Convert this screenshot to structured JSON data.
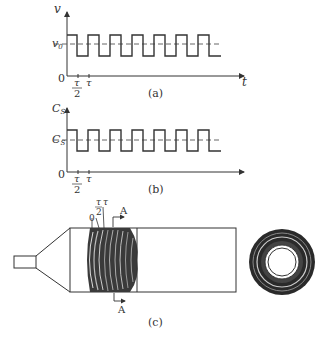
{
  "panel_a": {
    "y_label": "v",
    "x_label": "t",
    "origin": "0",
    "level_label": "v",
    "level_sub": "0",
    "tick_half_num": "τ",
    "tick_half_den": "2",
    "tick_full": "τ",
    "caption": "(a)"
  },
  "panel_b": {
    "y_label": "C",
    "y_sub": "S",
    "origin": "0",
    "level_label": "C",
    "level_sub": "S",
    "tick_half_num": "τ",
    "tick_half_den": "2",
    "tick_full": "τ",
    "caption": "(b)"
  },
  "panel_c": {
    "mark_zero": "0",
    "mark_half_num": "τ",
    "mark_half_den": "2",
    "mark_full": "τ",
    "section_top": "A",
    "section_bottom": "A",
    "caption": "(c)"
  },
  "colors": {
    "line": "#333333",
    "dash": "#555555",
    "rings_dark": "#2a2a2a"
  }
}
